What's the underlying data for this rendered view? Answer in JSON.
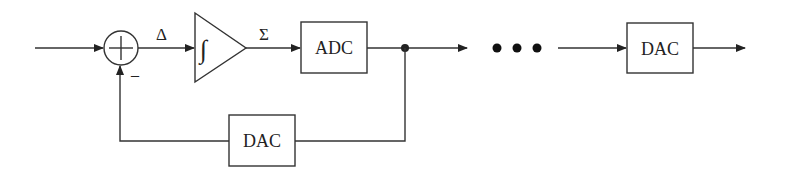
{
  "diagram": {
    "title": "",
    "summing_node": {
      "symbol": "+",
      "minus_sign": "–"
    },
    "labels": {
      "delta": "Δ",
      "sigma": "Σ"
    },
    "integrator": {
      "symbol": "∫"
    },
    "blocks": {
      "adc": "ADC",
      "feedback_dac": "DAC",
      "output_dac": "DAC"
    },
    "ellipsis_dots": 3,
    "colors": {
      "line": "#333333",
      "text": "#222222",
      "background": "#ffffff"
    }
  }
}
